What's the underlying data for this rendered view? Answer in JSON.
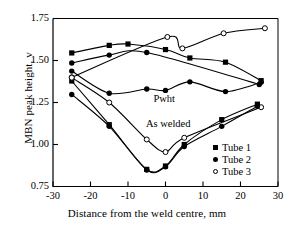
{
  "chart_data": {
    "type": "line",
    "title": "",
    "xlabel": "Distance from the weld centre, mm",
    "ylabel": "MBN peak height, v",
    "xlim": [
      -30,
      30
    ],
    "ylim": [
      0.75,
      1.75
    ],
    "xticks": [
      "-30",
      "-20",
      "-10",
      "0",
      "10",
      "20",
      "30"
    ],
    "xtick_values": [
      -30,
      -20,
      -10,
      0,
      10,
      20,
      30
    ],
    "yticks": [
      "0.75",
      "1.00",
      "1.25",
      "1.50",
      "1.75"
    ],
    "ytick_values": [
      0.75,
      1.0,
      1.25,
      1.5,
      1.75
    ],
    "grid": false,
    "legend_position": "lower-right",
    "legend": [
      {
        "label": "Tube 1",
        "marker": "filled-square"
      },
      {
        "label": "Tube 2",
        "marker": "filled-circle"
      },
      {
        "label": "Tube 3",
        "marker": "open-circle"
      }
    ],
    "annotations": [
      {
        "text": "Pwht",
        "x": 0.5,
        "y": 1.265
      },
      {
        "text": "As welded",
        "x": -1.5,
        "y": 1.115
      }
    ],
    "series": [
      {
        "name": "Tube 1 pwht",
        "group": "Pwht",
        "marker": "filled-square",
        "points": [
          {
            "x": -25.0,
            "y": 1.545
          },
          {
            "x": -15.0,
            "y": 1.59
          },
          {
            "x": -10.0,
            "y": 1.598
          },
          {
            "x": 0.0,
            "y": 1.565
          },
          {
            "x": 6.5,
            "y": 1.515
          },
          {
            "x": 16.0,
            "y": 1.49
          },
          {
            "x": 25.5,
            "y": 1.38
          }
        ]
      },
      {
        "name": "Tube 2 pwht",
        "group": "Pwht",
        "marker": "filled-circle",
        "points": [
          {
            "x": -25.0,
            "y": 1.485
          },
          {
            "x": -15.0,
            "y": 1.532
          },
          {
            "x": -5.0,
            "y": 1.548
          },
          {
            "x": 25.0,
            "y": 1.357
          }
        ]
      },
      {
        "name": "Tube 3 pwht",
        "group": "Pwht",
        "marker": "open-circle",
        "points": [
          {
            "x": -25.0,
            "y": 1.4
          },
          {
            "x": 0.5,
            "y": 1.64
          },
          {
            "x": 4.5,
            "y": 1.572
          },
          {
            "x": 15.5,
            "y": 1.662
          },
          {
            "x": 26.5,
            "y": 1.692
          }
        ]
      },
      {
        "name": "Tube 2 pwht flat",
        "group": "Pwht",
        "marker": "filled-circle",
        "points": [
          {
            "x": -25.0,
            "y": 1.437
          },
          {
            "x": -15.0,
            "y": 1.305
          },
          {
            "x": -5.0,
            "y": 1.33
          },
          {
            "x": 0.0,
            "y": 1.322
          },
          {
            "x": 6.5,
            "y": 1.373
          },
          {
            "x": 16.0,
            "y": 1.315
          },
          {
            "x": 25.5,
            "y": 1.37
          }
        ]
      },
      {
        "name": "Tube 1 as welded",
        "group": "As welded",
        "marker": "filled-square",
        "points": [
          {
            "x": -25.0,
            "y": 1.378
          },
          {
            "x": -15.0,
            "y": 1.118
          },
          {
            "x": -5.0,
            "y": 0.852
          },
          {
            "x": 0.0,
            "y": 0.872
          },
          {
            "x": 5.0,
            "y": 1.0
          },
          {
            "x": 15.0,
            "y": 1.148
          },
          {
            "x": 24.5,
            "y": 1.24
          }
        ]
      },
      {
        "name": "Tube 3 as welded",
        "group": "As welded",
        "marker": "open-circle",
        "points": [
          {
            "x": -25.0,
            "y": 1.398
          },
          {
            "x": -15.0,
            "y": 1.25
          },
          {
            "x": -5.0,
            "y": 1.03
          },
          {
            "x": 0.0,
            "y": 0.955
          },
          {
            "x": 5.0,
            "y": 1.04
          },
          {
            "x": 25.5,
            "y": 1.222
          }
        ]
      },
      {
        "name": "Tube 2 as welded",
        "group": "As welded",
        "marker": "filled-circle",
        "points": [
          {
            "x": -25.0,
            "y": 1.298
          },
          {
            "x": -15.0,
            "y": 1.108
          },
          {
            "x": -5.0,
            "y": 0.848
          },
          {
            "x": 0.0,
            "y": 0.868
          },
          {
            "x": 5.0,
            "y": 0.988
          },
          {
            "x": 15.0,
            "y": 1.108
          },
          {
            "x": 24.5,
            "y": 1.228
          }
        ]
      }
    ]
  }
}
